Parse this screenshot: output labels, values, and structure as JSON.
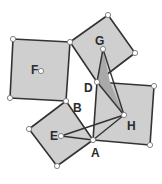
{
  "diagram": {
    "colors": {
      "square_fill": "#cfcfcf",
      "dark_fill": "#a9a9a9",
      "stroke": "#333333",
      "point_fill": "#ffffff"
    },
    "squares": [
      {
        "name": "square-F",
        "points": "13,39 70,42 66,101 10,98"
      },
      {
        "name": "square-G",
        "points": "70,42 108,15 135,53 97,82"
      },
      {
        "name": "square-right",
        "points": "97,82 154,86 150,145 93,140"
      },
      {
        "name": "square-bottom",
        "points": "66,101 93,140 57,166 29,129"
      }
    ],
    "shaded_triangles": [
      {
        "name": "triangle-GDH-upper",
        "points": "103,49 97,82 110,82"
      },
      {
        "name": "triangle-DH",
        "points": "97,82 110,82 124,115"
      }
    ],
    "segments": [
      {
        "name": "segment-D-G",
        "x1": 97,
        "y1": 82,
        "x2": 103,
        "y2": 49
      },
      {
        "name": "segment-G-H",
        "x1": 103,
        "y1": 49,
        "x2": 124,
        "y2": 115
      },
      {
        "name": "segment-D-H",
        "x1": 97,
        "y1": 82,
        "x2": 124,
        "y2": 115
      },
      {
        "name": "segment-A-H",
        "x1": 93,
        "y1": 140,
        "x2": 124,
        "y2": 115
      },
      {
        "name": "segment-E-H",
        "x1": 61,
        "y1": 136,
        "x2": 124,
        "y2": 115
      },
      {
        "name": "segment-E-A",
        "x1": 61,
        "y1": 136,
        "x2": 93,
        "y2": 140
      }
    ],
    "points": [
      {
        "name": "point-F-tl",
        "x": 13,
        "y": 39
      },
      {
        "name": "point-B-top",
        "x": 70,
        "y": 42
      },
      {
        "name": "point-F-bl",
        "x": 10,
        "y": 98
      },
      {
        "name": "point-B",
        "x": 66,
        "y": 101
      },
      {
        "name": "point-G-top",
        "x": 108,
        "y": 15
      },
      {
        "name": "point-G-right",
        "x": 135,
        "y": 53
      },
      {
        "name": "point-D",
        "x": 97,
        "y": 82
      },
      {
        "name": "point-right-tr",
        "x": 154,
        "y": 86
      },
      {
        "name": "point-right-br",
        "x": 150,
        "y": 145
      },
      {
        "name": "point-A",
        "x": 93,
        "y": 140
      },
      {
        "name": "point-bottom",
        "x": 57,
        "y": 166
      },
      {
        "name": "point-left",
        "x": 29,
        "y": 129
      },
      {
        "name": "point-F-center",
        "x": 41,
        "y": 71
      },
      {
        "name": "point-G-inner",
        "x": 103,
        "y": 49
      },
      {
        "name": "point-H",
        "x": 124,
        "y": 115
      },
      {
        "name": "point-E",
        "x": 61,
        "y": 136
      }
    ],
    "labels": {
      "F": {
        "text": "F",
        "x": 31,
        "y": 74
      },
      "G": {
        "text": "G",
        "x": 95,
        "y": 45
      },
      "D": {
        "text": "D",
        "x": 84,
        "y": 92
      },
      "B": {
        "text": "B",
        "x": 73,
        "y": 112
      },
      "H": {
        "text": "H",
        "x": 127,
        "y": 130
      },
      "E": {
        "text": "E",
        "x": 50,
        "y": 140
      },
      "A": {
        "text": "A",
        "x": 91,
        "y": 157
      }
    }
  }
}
